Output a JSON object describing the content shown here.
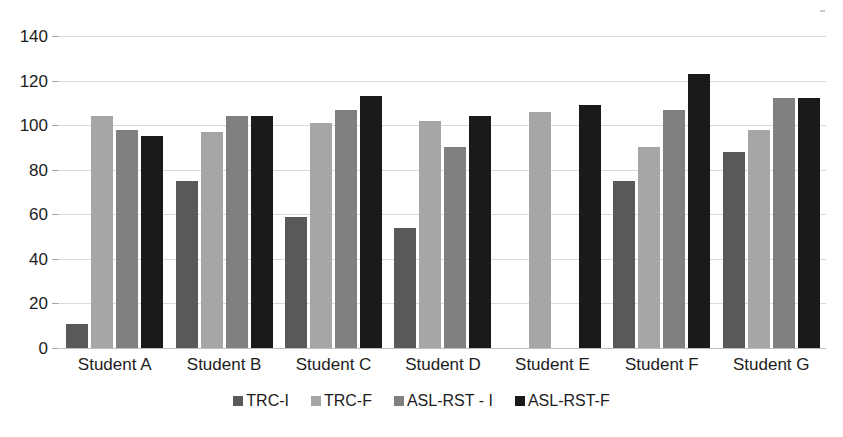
{
  "chart_data": {
    "type": "bar",
    "title": "",
    "subtitle": "",
    "xlabel": "",
    "ylabel": "",
    "categories": [
      "Student A",
      "Student B",
      "Student C",
      "Student D",
      "Student E",
      "Student F",
      "Student G"
    ],
    "series": [
      {
        "name": "TRC-I",
        "color": "#595959",
        "values": [
          11,
          75,
          59,
          54,
          0,
          75,
          88
        ]
      },
      {
        "name": "TRC-F",
        "color": "#a6a6a6",
        "values": [
          104,
          97,
          101,
          102,
          106,
          90,
          98
        ]
      },
      {
        "name": "ASL-RST - I",
        "color": "#808080",
        "values": [
          98,
          104,
          107,
          90,
          0,
          107,
          112
        ]
      },
      {
        "name": "ASL-RST-F",
        "color": "#1a1a1a",
        "values": [
          95,
          104,
          113,
          104,
          109,
          123,
          112
        ]
      }
    ],
    "ylim": [
      0,
      140
    ],
    "ytick_values": [
      0,
      20,
      40,
      60,
      80,
      100,
      120,
      140
    ],
    "ytick_labels": [
      "0",
      "20",
      "40",
      "60",
      "80",
      "100",
      "120",
      "140"
    ],
    "grid": true,
    "grid_color": "#d9d9d9",
    "legend_position": "bottom",
    "background": "#ffffff",
    "text_color": "#1c1c1c"
  }
}
